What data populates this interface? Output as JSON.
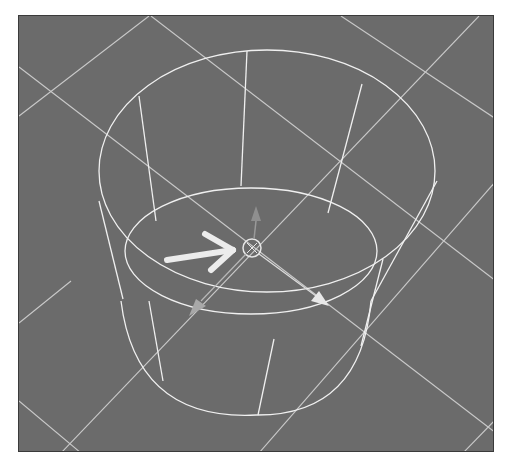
{
  "viewport": {
    "label": "3D perspective viewport",
    "background_color": "#6b6b6b",
    "grid_color": "#d8d8d8",
    "wire_color": "#f0f0f0"
  },
  "object": {
    "type": "cylinder",
    "display": "wireframe"
  },
  "gizmo": {
    "type": "move",
    "pivot_label": "pivot",
    "axes": [
      "y-up",
      "x",
      "z"
    ]
  },
  "annotation": {
    "type": "arrow",
    "points_to": "pivot",
    "color": "#e8e8e8"
  }
}
